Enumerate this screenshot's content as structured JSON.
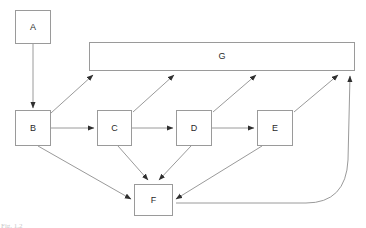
{
  "diagram": {
    "background_color": "#ffffff",
    "line_color": "#9a9a9a",
    "node_border_color": "#9a9a9a",
    "node_fill_color": "#ffffff",
    "label_color": "#2a2a2a",
    "nodes": [
      {
        "id": "A",
        "label": "A",
        "x": 15,
        "y": 10,
        "w": 36,
        "h": 34
      },
      {
        "id": "B",
        "label": "B",
        "x": 15,
        "y": 110,
        "w": 36,
        "h": 36
      },
      {
        "id": "C",
        "label": "C",
        "x": 97,
        "y": 110,
        "w": 35,
        "h": 36
      },
      {
        "id": "D",
        "label": "D",
        "x": 176,
        "y": 110,
        "w": 36,
        "h": 36
      },
      {
        "id": "E",
        "label": "E",
        "x": 257,
        "y": 110,
        "w": 36,
        "h": 36
      },
      {
        "id": "F",
        "label": "F",
        "x": 134,
        "y": 184,
        "w": 39,
        "h": 32
      },
      {
        "id": "G",
        "label": "G",
        "x": 89,
        "y": 42,
        "w": 266,
        "h": 29
      }
    ],
    "edges": [
      {
        "from": "A",
        "to": "B",
        "style": "straight"
      },
      {
        "from": "B",
        "to": "C",
        "style": "straight"
      },
      {
        "from": "C",
        "to": "D",
        "style": "straight"
      },
      {
        "from": "D",
        "to": "E",
        "style": "straight"
      },
      {
        "from": "B",
        "to": "G",
        "style": "straight"
      },
      {
        "from": "C",
        "to": "G",
        "style": "straight"
      },
      {
        "from": "D",
        "to": "G",
        "style": "straight"
      },
      {
        "from": "E",
        "to": "G",
        "style": "straight"
      },
      {
        "from": "B",
        "to": "F",
        "style": "straight"
      },
      {
        "from": "C",
        "to": "F",
        "style": "straight"
      },
      {
        "from": "D",
        "to": "F",
        "style": "straight"
      },
      {
        "from": "E",
        "to": "F",
        "style": "straight"
      },
      {
        "from": "G",
        "to": "F",
        "style": "curved"
      }
    ]
  },
  "watermark": {
    "caption": "Fig. 1.2",
    "corner_text": ""
  }
}
